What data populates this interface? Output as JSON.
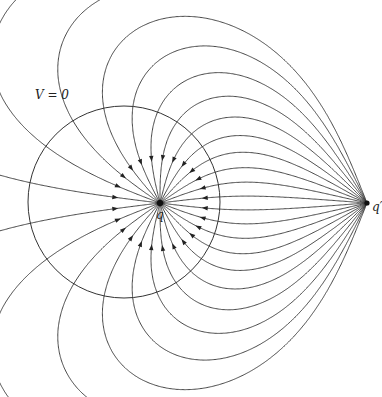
{
  "figure": {
    "equipotential_label": "V = 0",
    "charges": [
      {
        "name": "q",
        "label": "q",
        "x": 160,
        "y": 203,
        "charge": -1.0
      },
      {
        "name": "q-prime",
        "label": "q′",
        "x": 367,
        "y": 203,
        "charge": 2.667
      }
    ],
    "sphere": {
      "cx": 124,
      "cy": 202,
      "r": 96
    },
    "line_count": 26,
    "colors": {
      "line": "#333333",
      "background": "#ffffff"
    }
  },
  "labels": {
    "v0": {
      "text": "V = 0",
      "x": 35,
      "y": 88
    },
    "q": {
      "text": "q",
      "x": 156,
      "y": 208
    },
    "qprime": {
      "text": "q′",
      "x": 372,
      "y": 200
    }
  }
}
